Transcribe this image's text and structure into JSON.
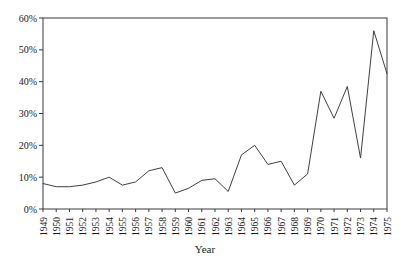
{
  "figure": {
    "background": "#ffffff",
    "axis_color": "#3a3a3a",
    "line_color": "#404040",
    "text_color": "#1a1a1a"
  },
  "chart_data": {
    "type": "line",
    "title": "",
    "xlabel": "Year",
    "ylabel": "",
    "x": [
      "1949",
      "1950",
      "1951",
      "1952",
      "1953",
      "1954",
      "1955",
      "1956",
      "1957",
      "1958",
      "1959",
      "1960",
      "1961",
      "1962",
      "1963",
      "1964",
      "1965",
      "1966",
      "1967",
      "1968",
      "1969",
      "1970",
      "1971",
      "1972",
      "1973",
      "1974",
      "1975"
    ],
    "series": [
      {
        "name": "percent",
        "values": [
          8,
          7,
          7,
          7.5,
          8.5,
          10,
          7.5,
          8.5,
          12,
          13,
          5,
          6.5,
          9,
          9.5,
          5.5,
          17,
          20,
          14,
          15,
          7.5,
          11,
          37,
          28.5,
          38.5,
          16,
          56,
          42.5
        ]
      }
    ],
    "ylim": [
      0,
      60
    ],
    "yticks": [
      0,
      10,
      20,
      30,
      40,
      50,
      60
    ],
    "ytick_labels": [
      "0%",
      "10%",
      "20%",
      "30%",
      "40%",
      "50%",
      "60%"
    ],
    "grid": false,
    "legend": "none",
    "plot_box": true
  }
}
